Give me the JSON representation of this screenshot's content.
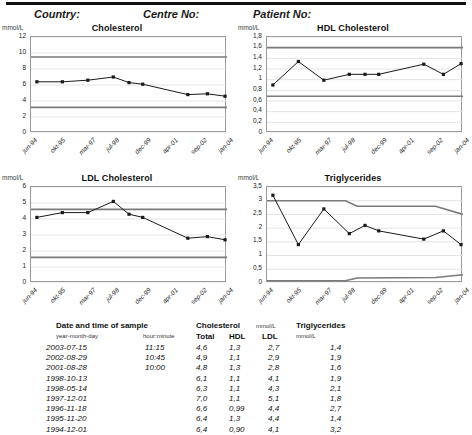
{
  "header": {
    "country_label": "Country:",
    "centre_label": "Centre No:",
    "patient_label": "Patient No:"
  },
  "axis": {
    "x_labels": [
      "jun-94",
      "okt-95",
      "mar-97",
      "jul-98",
      "dec-99",
      "apr-01",
      "sep-02",
      "jan-04"
    ],
    "unit": "mmol/L"
  },
  "chart_data": [
    {
      "type": "line",
      "title": "Cholesterol",
      "ylabel": "mmol/L",
      "xlabel": "",
      "ylim": [
        0,
        12
      ],
      "yticks": [
        "0",
        "2",
        "4",
        "6",
        "8",
        "10",
        "12"
      ],
      "grid": true,
      "x": [
        "jun-94",
        "okt-95",
        "mar-97",
        "jul-98",
        "dec-99",
        "apr-01",
        "sep-02",
        "jan-04"
      ],
      "series": [
        {
          "name": "Total cholesterol",
          "color": "#1a1a1a",
          "points": [
            {
              "t": 0.03,
              "v": 6.4
            },
            {
              "t": 0.16,
              "v": 6.4
            },
            {
              "t": 0.29,
              "v": 6.6
            },
            {
              "t": 0.42,
              "v": 7.0
            },
            {
              "t": 0.5,
              "v": 6.3
            },
            {
              "t": 0.57,
              "v": 6.1
            },
            {
              "t": 0.8,
              "v": 4.8
            },
            {
              "t": 0.9,
              "v": 4.9
            },
            {
              "t": 0.99,
              "v": 4.6
            }
          ]
        }
      ],
      "reference_lines": [
        {
          "name": "upper",
          "value": 9.5,
          "color": "#7a7a7a"
        },
        {
          "name": "lower",
          "value": 3.2,
          "color": "#7a7a7a"
        }
      ]
    },
    {
      "type": "line",
      "title": "HDL Cholesterol",
      "ylabel": "mmol/L",
      "xlabel": "",
      "ylim": [
        0,
        1.8
      ],
      "yticks": [
        "0",
        "0,2",
        "0,4",
        "0,6",
        "0,8",
        "1",
        "1,2",
        "1,4",
        "1,6",
        "1,8"
      ],
      "grid": true,
      "x": [
        "jun-94",
        "okt-95",
        "mar-97",
        "jul-98",
        "dec-99",
        "apr-01",
        "sep-02",
        "jan-04"
      ],
      "series": [
        {
          "name": "HDL",
          "color": "#1a1a1a",
          "points": [
            {
              "t": 0.03,
              "v": 0.9
            },
            {
              "t": 0.16,
              "v": 1.34
            },
            {
              "t": 0.29,
              "v": 0.99
            },
            {
              "t": 0.42,
              "v": 1.1
            },
            {
              "t": 0.5,
              "v": 1.1
            },
            {
              "t": 0.57,
              "v": 1.1
            },
            {
              "t": 0.8,
              "v": 1.29
            },
            {
              "t": 0.9,
              "v": 1.1
            },
            {
              "t": 0.99,
              "v": 1.3
            }
          ]
        }
      ],
      "reference_lines": [
        {
          "name": "upper",
          "value": 1.6,
          "color": "#7a7a7a"
        },
        {
          "name": "lower",
          "value": 0.69,
          "color": "#7a7a7a"
        }
      ]
    },
    {
      "type": "line",
      "title": "LDL Cholesterol",
      "ylabel": "mmol/L",
      "xlabel": "",
      "ylim": [
        0,
        6
      ],
      "yticks": [
        "0",
        "1",
        "2",
        "3",
        "4",
        "5",
        "6"
      ],
      "grid": true,
      "x": [
        "jun-94",
        "okt-95",
        "mar-97",
        "jul-98",
        "dec-99",
        "apr-01",
        "sep-02",
        "jan-04"
      ],
      "series": [
        {
          "name": "LDL",
          "color": "#1a1a1a",
          "points": [
            {
              "t": 0.03,
              "v": 4.1
            },
            {
              "t": 0.16,
              "v": 4.4
            },
            {
              "t": 0.29,
              "v": 4.4
            },
            {
              "t": 0.42,
              "v": 5.1
            },
            {
              "t": 0.5,
              "v": 4.3
            },
            {
              "t": 0.57,
              "v": 4.1
            },
            {
              "t": 0.8,
              "v": 2.8
            },
            {
              "t": 0.9,
              "v": 2.9
            },
            {
              "t": 0.99,
              "v": 2.7
            }
          ]
        }
      ],
      "reference_lines": [
        {
          "name": "upper",
          "value": 4.6,
          "color": "#7a7a7a"
        },
        {
          "name": "lower",
          "value": 1.6,
          "color": "#7a7a7a"
        }
      ]
    },
    {
      "type": "line",
      "title": "Triglycerides",
      "ylabel": "mmol/L",
      "xlabel": "",
      "ylim": [
        0,
        3.5
      ],
      "yticks": [
        "0",
        "0,5",
        "1",
        "1,5",
        "2",
        "2,5",
        "3",
        "3,5"
      ],
      "grid": true,
      "x": [
        "jun-94",
        "okt-95",
        "mar-97",
        "jul-98",
        "dec-99",
        "apr-01",
        "sep-02",
        "jan-04"
      ],
      "series": [
        {
          "name": "Triglycerides",
          "color": "#1a1a1a",
          "points": [
            {
              "t": 0.03,
              "v": 3.2
            },
            {
              "t": 0.16,
              "v": 1.4
            },
            {
              "t": 0.29,
              "v": 2.7
            },
            {
              "t": 0.42,
              "v": 1.8
            },
            {
              "t": 0.5,
              "v": 2.1
            },
            {
              "t": 0.57,
              "v": 1.9
            },
            {
              "t": 0.8,
              "v": 1.6
            },
            {
              "t": 0.9,
              "v": 1.9
            },
            {
              "t": 0.99,
              "v": 1.4
            }
          ]
        }
      ],
      "reference_lines": [
        {
          "name": "upper-stepped",
          "color": "#7a7a7a",
          "path": [
            {
              "t": 0.0,
              "v": 3.0
            },
            {
              "t": 0.4,
              "v": 3.0
            },
            {
              "t": 0.46,
              "v": 2.8
            },
            {
              "t": 0.86,
              "v": 2.8
            },
            {
              "t": 1.0,
              "v": 2.5
            }
          ]
        },
        {
          "name": "lower-stepped",
          "color": "#7a7a7a",
          "path": [
            {
              "t": 0.0,
              "v": 0.08
            },
            {
              "t": 0.4,
              "v": 0.08
            },
            {
              "t": 0.46,
              "v": 0.18
            },
            {
              "t": 0.86,
              "v": 0.2
            },
            {
              "t": 1.0,
              "v": 0.3
            }
          ]
        }
      ]
    }
  ],
  "table": {
    "headers": {
      "date_title": "Date and time of sample",
      "date_sub": "year-month-day",
      "time_sub": "hour:minute",
      "chol_title": "Cholesterol",
      "chol_unit": "mmol/L",
      "col_total": "Total",
      "col_hdl": "HDL",
      "col_ldl": "LDL",
      "trig_title": "Triglycerides",
      "trig_unit": "mmol/L"
    },
    "rows": [
      {
        "date": "2003-07-15",
        "time": "11:15",
        "total": "4,6",
        "hdl": "1,3",
        "ldl": "2,7",
        "trig": "1,4"
      },
      {
        "date": "2002-08-29",
        "time": "10:45",
        "total": "4,9",
        "hdl": "1,1",
        "ldl": "2,9",
        "trig": "1,9"
      },
      {
        "date": "2001-08-28",
        "time": "10:00",
        "total": "4,8",
        "hdl": "1,3",
        "ldl": "2,8",
        "trig": "1,6"
      },
      {
        "date": "1998-10-13",
        "time": "",
        "total": "6,1",
        "hdl": "1,1",
        "ldl": "4,1",
        "trig": "1,9"
      },
      {
        "date": "1998-05-14",
        "time": "",
        "total": "6,3",
        "hdl": "1,1",
        "ldl": "4,3",
        "trig": "2,1"
      },
      {
        "date": "1997-12-01",
        "time": "",
        "total": "7,0",
        "hdl": "1,1",
        "ldl": "5,1",
        "trig": "1,8"
      },
      {
        "date": "1996-11-18",
        "time": "",
        "total": "6,6",
        "hdl": "0,99",
        "ldl": "4,4",
        "trig": "2,7"
      },
      {
        "date": "1995-11-20",
        "time": "",
        "total": "6,4",
        "hdl": "1,3",
        "ldl": "4,4",
        "trig": "1,4"
      },
      {
        "date": "1994-12-01",
        "time": "",
        "total": "6,4",
        "hdl": "0,90",
        "ldl": "4,1",
        "trig": "3,2"
      }
    ]
  }
}
